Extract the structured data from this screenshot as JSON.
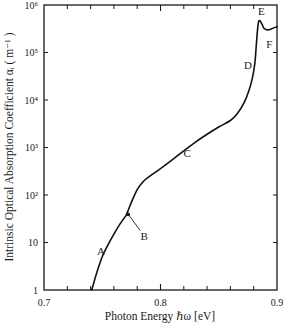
{
  "chart_data": {
    "type": "line",
    "title": "",
    "xlabel": "Photon Energy ℏω [eV]",
    "ylabel": "Intrinsic Optical Absorption Coefficient αᵢ ( m⁻¹ )",
    "xlim": [
      0.7,
      0.9
    ],
    "ylim": [
      1,
      1000000
    ],
    "yscale": "log",
    "grid": false,
    "legend": "none",
    "x_ticks": [
      {
        "value": 0.7,
        "label": "0.7"
      },
      {
        "value": 0.8,
        "label": "0.8"
      },
      {
        "value": 0.9,
        "label": "0.9"
      }
    ],
    "x_minor_ticks": [
      0.72,
      0.74,
      0.76,
      0.78,
      0.82,
      0.84,
      0.86,
      0.88
    ],
    "y_ticks": [
      {
        "value": 1,
        "label": "1"
      },
      {
        "value": 10,
        "label": "10"
      },
      {
        "value": 100,
        "label": "10²"
      },
      {
        "value": 1000,
        "label": "10³"
      },
      {
        "value": 10000,
        "label": "10⁴"
      },
      {
        "value": 100000,
        "label": "10⁵"
      },
      {
        "value": 1000000,
        "label": "10⁶"
      }
    ],
    "series": [
      {
        "name": "absorption",
        "x": [
          0.741,
          0.745,
          0.75,
          0.755,
          0.76,
          0.765,
          0.77,
          0.771,
          0.775,
          0.78,
          0.785,
          0.79,
          0.8,
          0.81,
          0.82,
          0.83,
          0.84,
          0.85,
          0.86,
          0.866,
          0.872,
          0.876,
          0.879,
          0.881,
          0.882,
          0.883,
          0.884,
          0.885,
          0.887,
          0.889,
          0.892,
          0.896,
          0.9
        ],
        "y": [
          1,
          2.2,
          5,
          9,
          15,
          24,
          36,
          40,
          70,
          130,
          190,
          240,
          360,
          550,
          850,
          1300,
          1900,
          2700,
          3700,
          5200,
          9000,
          16000,
          30000,
          60000,
          120000,
          250000,
          420000,
          470000,
          400000,
          320000,
          300000,
          320000,
          350000
        ]
      }
    ],
    "annotations": [
      {
        "text": "A",
        "x": 0.749,
        "y": 6.5
      },
      {
        "text": "B",
        "x": 0.786,
        "y": 14,
        "arrow_to": {
          "x": 0.771,
          "y": 40
        }
      },
      {
        "text": "C",
        "x": 0.823,
        "y": 750
      },
      {
        "text": "D",
        "x": 0.875,
        "y": 55000
      },
      {
        "text": "E",
        "x": 0.8865,
        "y": 750000
      },
      {
        "text": "F",
        "x": 0.8935,
        "y": 150000
      }
    ]
  }
}
